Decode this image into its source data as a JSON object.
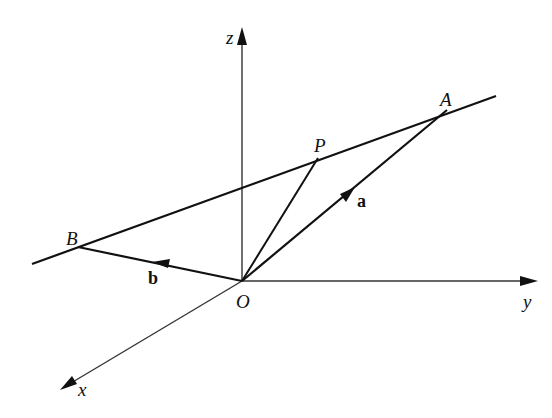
{
  "diagram": {
    "title": "",
    "stroke_color": "#111111",
    "axes": {
      "z": {
        "label": "z",
        "from": [
          242,
          281
        ],
        "to": [
          242,
          28
        ]
      },
      "y": {
        "label": "y",
        "from": [
          242,
          281
        ],
        "to": [
          538,
          281
        ]
      },
      "x": {
        "label": "x",
        "from": [
          242,
          281
        ],
        "to": [
          60,
          390
        ]
      }
    },
    "points": {
      "O": {
        "label": "O",
        "pos": [
          242,
          281
        ]
      },
      "A": {
        "label": "A",
        "pos": [
          447,
          110
        ]
      },
      "B": {
        "label": "B",
        "pos": [
          78,
          247
        ]
      },
      "P": {
        "label": "P",
        "pos": [
          318,
          158
        ]
      }
    },
    "line_AB": {
      "from": [
        32,
        264
      ],
      "to": [
        496,
        96
      ]
    },
    "vectors": {
      "a": {
        "label": "a",
        "from": "O",
        "to": "A"
      },
      "b": {
        "label": "b",
        "from": "O",
        "to": "B"
      }
    },
    "segment_OP": {
      "from": "O",
      "to": "P"
    }
  }
}
